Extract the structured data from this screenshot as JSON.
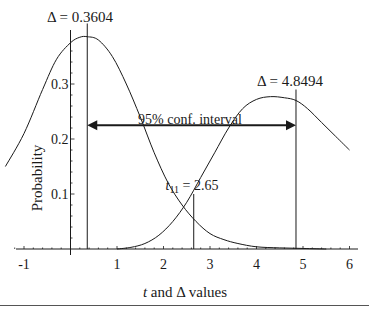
{
  "chart_data": {
    "type": "line",
    "title": "",
    "xlabel": "t and Δ values",
    "xlabel_parts": {
      "italic": "t",
      "rest": " and Δ values"
    },
    "ylabel": "Probability",
    "xlim": [
      -1.4,
      6.2
    ],
    "ylim": [
      0,
      0.4
    ],
    "x_ticks": [
      -1,
      1,
      2,
      3,
      4,
      5,
      6
    ],
    "x_tick_labels": [
      "-1",
      "1",
      "2",
      "3",
      "4",
      "5",
      "6"
    ],
    "y_ticks": [
      0.1,
      0.2,
      0.3
    ],
    "y_tick_labels": [
      "0.1",
      "0.2",
      "0.3"
    ],
    "grid": false,
    "legend": null,
    "series": [
      {
        "name": "Distribution centered at 0.3604 (left curve)",
        "x": [
          -1.4,
          -1.0,
          -0.6,
          -0.3,
          0.0,
          0.2,
          0.36,
          0.6,
          0.9,
          1.2,
          1.5,
          1.8,
          2.1,
          2.4,
          2.7,
          3.0,
          3.3,
          3.6,
          4.0,
          4.5,
          5.0,
          5.5
        ],
        "y": [
          0.15,
          0.21,
          0.29,
          0.345,
          0.375,
          0.385,
          0.386,
          0.38,
          0.35,
          0.3,
          0.24,
          0.175,
          0.12,
          0.08,
          0.05,
          0.028,
          0.017,
          0.01,
          0.004,
          0.002,
          0.001,
          0.0
        ]
      },
      {
        "name": "Distribution centered at 4.8494 (right curve)",
        "x": [
          1.0,
          1.3,
          1.6,
          1.9,
          2.2,
          2.5,
          2.8,
          3.1,
          3.4,
          3.7,
          4.0,
          4.3,
          4.6,
          4.85,
          5.1,
          5.4,
          5.7,
          6.0
        ],
        "y": [
          0.0,
          0.003,
          0.01,
          0.025,
          0.05,
          0.085,
          0.13,
          0.175,
          0.22,
          0.255,
          0.272,
          0.277,
          0.275,
          0.27,
          0.255,
          0.23,
          0.205,
          0.18
        ]
      }
    ],
    "vertical_lines": [
      {
        "x": 0.3604,
        "label": "Δ = 0.3604",
        "y_top": 0.41
      },
      {
        "x": 4.8494,
        "label": "Δ = 4.8494",
        "y_top": 0.29
      },
      {
        "x": 2.65,
        "label_prefix": "t",
        "label_sub": "11",
        "label_rest": " = 2.65",
        "y_top": 0.1
      }
    ],
    "annotations": [
      {
        "type": "double_arrow",
        "x_from": 0.3604,
        "x_to": 4.8494,
        "y": 0.225,
        "label": "95% conf. interval"
      }
    ]
  },
  "labels": {
    "delta_left": "Δ = 0.3604",
    "delta_right": "Δ = 4.8494",
    "t_stat_prefix": "t",
    "t_stat_sub": "11",
    "t_stat_rest": " = 2.65",
    "interval": "95% conf. interval",
    "ylabel": "Probability",
    "xlabel_italic": "t",
    "xlabel_rest": " and Δ values"
  },
  "colors": {
    "line": "#1a1a1a",
    "background": "#ffffff"
  }
}
